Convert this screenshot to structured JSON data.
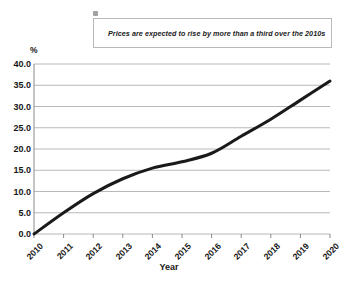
{
  "callout": {
    "text": "Prices are expected to rise by more than a third over the 2010s",
    "dot_icon": "callout-marker-dot",
    "bar_color": "#8c8c8c",
    "border_color": "#b9b9b9"
  },
  "chart_data": {
    "type": "line",
    "title": "",
    "xlabel": "Year",
    "ylabel": "%",
    "categories": [
      "2010",
      "2011",
      "2012",
      "2013",
      "2014",
      "2015",
      "2016",
      "2017",
      "2018",
      "2019",
      "2020"
    ],
    "values": [
      0.0,
      5.0,
      9.5,
      13.0,
      15.5,
      17.0,
      19.0,
      23.0,
      27.0,
      31.5,
      36.0
    ],
    "series": [
      {
        "name": "Price change",
        "values": [
          0.0,
          5.0,
          9.5,
          13.0,
          15.5,
          17.0,
          19.0,
          23.0,
          27.0,
          31.5,
          36.0
        ],
        "color": "#1a1a1a"
      }
    ],
    "ylim": [
      0.0,
      40.0
    ],
    "ytick_labels": [
      "40.0",
      "35.0",
      "30.0",
      "25.0",
      "20.0",
      "15.0",
      "10.0",
      "5.0",
      "0.0"
    ],
    "ytick_values": [
      40.0,
      35.0,
      30.0,
      25.0,
      20.0,
      15.0,
      10.0,
      5.0,
      0.0
    ],
    "grid": true,
    "grid_color": "#a6a6a6",
    "legend": false,
    "legend_position": "none",
    "line_color": "#1a1a1a",
    "line_width": 3
  }
}
